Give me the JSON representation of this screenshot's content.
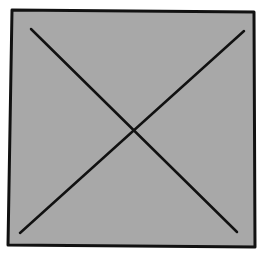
{
  "diagram": {
    "shape": "square-with-x",
    "fill_color": "#a8a8a8",
    "stroke_color": "#111111",
    "square": {
      "points": [
        [
          12,
          10
        ],
        [
          254,
          12
        ],
        [
          255,
          247
        ],
        [
          8,
          245
        ]
      ]
    },
    "diagonals": [
      {
        "from": [
          31,
          29
        ],
        "to": [
          237,
          232
        ]
      },
      {
        "from": [
          244,
          31
        ],
        "to": [
          20,
          233
        ]
      }
    ]
  }
}
